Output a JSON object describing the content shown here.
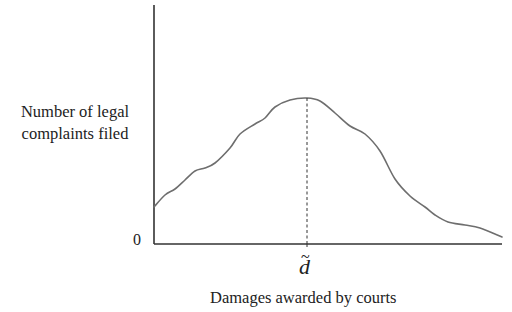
{
  "chart_data": {
    "type": "line",
    "title": "",
    "xlabel": "Damages awarded by courts",
    "ylabel": "Number of legal complaints filed",
    "ylabel_lines": [
      "Number of legal",
      "complaints filed"
    ],
    "y_origin_label": "0",
    "x_marker_label": "d",
    "x_marker_description": "d-tilde (modal damages level, marked by dashed vertical line at curve peak)",
    "grid": false,
    "legend": null,
    "series": [
      {
        "name": "Complaints filed vs. damages awarded",
        "shape": "unimodal, roughly bell-shaped distribution peaking at d-tilde",
        "points_px": [
          [
            154,
            207
          ],
          [
            165,
            195
          ],
          [
            175,
            189
          ],
          [
            185,
            180
          ],
          [
            195,
            171
          ],
          [
            205,
            168
          ],
          [
            215,
            163
          ],
          [
            230,
            148
          ],
          [
            240,
            134
          ],
          [
            255,
            124
          ],
          [
            265,
            118
          ],
          [
            275,
            107
          ],
          [
            290,
            100
          ],
          [
            307,
            98
          ],
          [
            320,
            101
          ],
          [
            335,
            113
          ],
          [
            350,
            126
          ],
          [
            365,
            134
          ],
          [
            380,
            151
          ],
          [
            395,
            179
          ],
          [
            410,
            196
          ],
          [
            425,
            207
          ],
          [
            435,
            215
          ],
          [
            448,
            222
          ],
          [
            465,
            225
          ],
          [
            480,
            228
          ],
          [
            502,
            237
          ]
        ]
      }
    ],
    "axes": {
      "origin_px": [
        154,
        244
      ],
      "x_axis_end_px": [
        502,
        244
      ],
      "y_axis_top_px": [
        154,
        5
      ]
    },
    "marker": {
      "x_px": 307,
      "y_top_px": 98,
      "y_bottom_px": 244,
      "style": "dashed"
    },
    "colors": {
      "axis": "#333333",
      "curve": "#6e6e6e",
      "dashed": "#333333",
      "text": "#222222"
    }
  }
}
